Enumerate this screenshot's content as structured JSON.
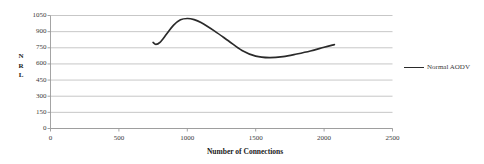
{
  "chart_data": {
    "type": "line",
    "title": "",
    "xlabel": "Number of Connections",
    "ylabel": "NRL",
    "xlim": [
      0,
      2500
    ],
    "ylim": [
      0,
      1050
    ],
    "grid": true,
    "legend_position": "right",
    "xticks": [
      "0",
      "500",
      "1000",
      "1500",
      "2000",
      "2500"
    ],
    "yticks": [
      "0",
      "150",
      "300",
      "450",
      "600",
      "750",
      "900",
      "1050"
    ],
    "series": [
      {
        "name": "Normal AODV",
        "color": "#2a2a2a",
        "x": [
          750,
          770,
          800,
          850,
          900,
          950,
          1000,
          1050,
          1100,
          1200,
          1300,
          1400,
          1500,
          1600,
          1700,
          1800,
          1900,
          2000,
          2075
        ],
        "values": [
          800,
          782,
          800,
          880,
          960,
          1010,
          1022,
          1012,
          985,
          905,
          815,
          725,
          672,
          658,
          668,
          692,
          720,
          755,
          780
        ]
      }
    ]
  },
  "axis": {
    "ylabel_chars": [
      "N",
      "R",
      "L"
    ]
  }
}
